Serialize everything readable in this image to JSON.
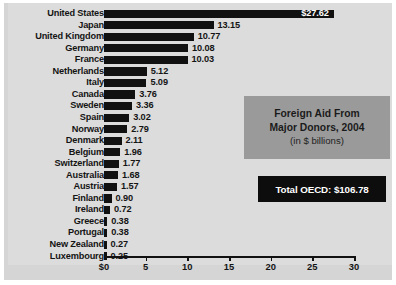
{
  "chart_data": {
    "type": "bar",
    "orientation": "horizontal",
    "title": "Foreign Aid From Major Donors, 2004",
    "subtitle": "(in $ billions)",
    "xlabel": "",
    "ylabel": "",
    "xlim": [
      0,
      30
    ],
    "xticks": [
      "$0",
      "5",
      "10",
      "15",
      "20",
      "25",
      "30"
    ],
    "xtick_values": [
      0,
      5,
      10,
      15,
      20,
      25,
      30
    ],
    "grid": false,
    "legend": false,
    "bar_color": "#111111",
    "categories": [
      "United States",
      "Japan",
      "United Kingdom",
      "Germany",
      "France",
      "Netherlands",
      "Italy",
      "Canada",
      "Sweden",
      "Spain",
      "Norway",
      "Denmark",
      "Belgium",
      "Switzerland",
      "Australia",
      "Austria",
      "Finland",
      "Ireland",
      "Greece",
      "Portugal",
      "New Zealand",
      "Luxembourg"
    ],
    "values": [
      27.62,
      13.15,
      10.77,
      10.08,
      10.03,
      5.12,
      5.09,
      3.76,
      3.36,
      3.02,
      2.79,
      2.11,
      1.96,
      1.77,
      1.68,
      1.57,
      0.9,
      0.72,
      0.38,
      0.38,
      0.27,
      0.25
    ],
    "value_labels": [
      "$27.62",
      "13.15",
      "10.77",
      "10.08",
      "10.03",
      "5.12",
      "5.09",
      "3.76",
      "3.36",
      "3.02",
      "2.79",
      "2.11",
      "1.96",
      "1.77",
      "1.68",
      "1.57",
      "0.90",
      "0.72",
      "0.38",
      "0.38",
      "0.27",
      "0.25"
    ],
    "annotations": [
      {
        "text": "Total OECD: $106.78",
        "kind": "total-badge"
      }
    ]
  },
  "title_box": {
    "line1": "Foreign Aid From",
    "line2": "Major Donors, 2004",
    "line3": "(in $ billions)"
  },
  "total_box": {
    "label": "Total OECD: $106.78"
  },
  "colors": {
    "bar": "#111111",
    "plot_background": "#dcdcdc",
    "frame_background": "#d5d5d5",
    "title_box_background": "#9a9a9a",
    "total_box_background": "#0d0d0d",
    "total_box_text": "#ffffff",
    "text": "#141414"
  }
}
